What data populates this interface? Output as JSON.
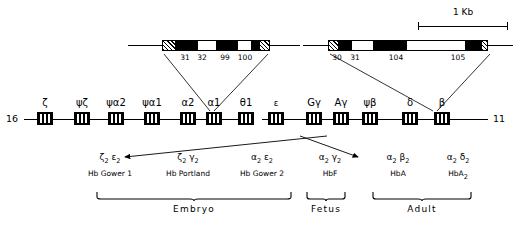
{
  "figure": {
    "scale_bar": {
      "label": "1 Kb"
    },
    "chromosomes": [
      {
        "id": "alpha",
        "number": "16",
        "side": "left"
      },
      {
        "id": "beta",
        "number": "11",
        "side": "right"
      }
    ]
  },
  "alpha_cluster": {
    "chromosome": "16",
    "genes": [
      {
        "label": "ζ",
        "name": "zeta"
      },
      {
        "label": "ψζ",
        "name": "psi-zeta"
      },
      {
        "label": "ψα2",
        "name": "psi-alpha-2"
      },
      {
        "label": "ψα1",
        "name": "psi-alpha-1"
      },
      {
        "label": "α2",
        "name": "alpha-2"
      },
      {
        "label": "α1",
        "name": "alpha-1"
      },
      {
        "label": "θ1",
        "name": "theta-1"
      }
    ]
  },
  "beta_cluster": {
    "chromosome": "11",
    "genes": [
      {
        "label": "ε",
        "name": "epsilon"
      },
      {
        "label": "Gγ",
        "name": "g-gamma"
      },
      {
        "label": "Aγ",
        "name": "a-gamma"
      },
      {
        "label": "ψβ",
        "name": "psi-beta"
      },
      {
        "label": "δ",
        "name": "delta"
      },
      {
        "label": "β",
        "name": "beta"
      }
    ]
  },
  "expanded_alpha_gene": {
    "source_gene": "α1",
    "codon_labels": [
      "31",
      "32",
      "99",
      "100"
    ]
  },
  "expanded_beta_gene": {
    "source_gene": "β",
    "codon_labels": [
      "30",
      "31",
      "104",
      "105"
    ]
  },
  "hemoglobins": [
    {
      "tetramer_a": "ζ",
      "tetramer_a_sub": "2",
      "tetramer_b": "ε",
      "tetramer_b_sub": "2",
      "name": "Hb Gower 1"
    },
    {
      "tetramer_a": "ζ",
      "tetramer_a_sub": "2",
      "tetramer_b": "γ",
      "tetramer_b_sub": "2",
      "name": "Hb Portland"
    },
    {
      "tetramer_a": "α",
      "tetramer_a_sub": "2",
      "tetramer_b": "ε",
      "tetramer_b_sub": "2",
      "name": "Hb Gower 2"
    },
    {
      "tetramer_a": "α",
      "tetramer_a_sub": "2",
      "tetramer_b": "γ",
      "tetramer_b_sub": "2",
      "name": "HbF"
    },
    {
      "tetramer_a": "α",
      "tetramer_a_sub": "2",
      "tetramer_b": "β",
      "tetramer_b_sub": "2",
      "name": "HbA"
    },
    {
      "tetramer_a": "α",
      "tetramer_a_sub": "2",
      "tetramer_b": "δ",
      "tetramer_b_sub": "2",
      "name": "HbA",
      "name_sub": "2"
    }
  ],
  "stages": [
    {
      "label": "Embryo"
    },
    {
      "label": "Fetus"
    },
    {
      "label": "Adult"
    }
  ],
  "colors": {
    "ink": "#000000",
    "paper": "#ffffff"
  }
}
